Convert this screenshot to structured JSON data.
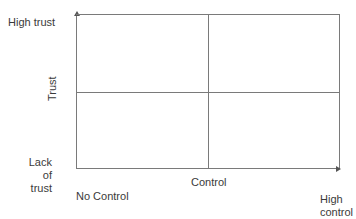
{
  "diagram": {
    "type": "2x2-matrix",
    "y_axis": {
      "title": "Trust",
      "top_label": "High trust",
      "bottom_label_line1": "Lack of",
      "bottom_label_line2": "trust"
    },
    "x_axis": {
      "title": "Control",
      "left_label": "No Control",
      "right_label_line1": "High",
      "right_label_line2": "control"
    },
    "colors": {
      "lines": "#7a7a7a",
      "text": "#3a3a3a",
      "background": "#ffffff"
    }
  }
}
